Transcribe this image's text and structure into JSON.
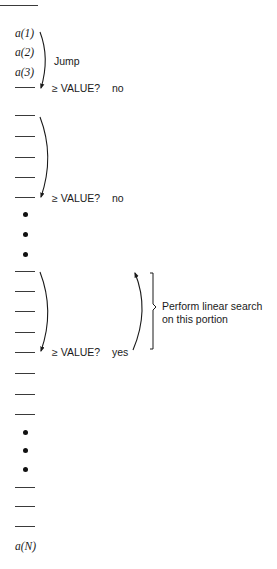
{
  "diagram": {
    "array_first": [
      "a(1)",
      "a(2)",
      "a(3)"
    ],
    "array_last": "a(N)",
    "jump_label": "Jump",
    "checks": [
      {
        "question": "≥ VALUE?",
        "answer": "no"
      },
      {
        "question": "≥ VALUE?",
        "answer": "no"
      },
      {
        "question": "≥ VALUE?",
        "answer": "yes"
      }
    ],
    "linear_search_label_line1": "Perform linear search",
    "linear_search_label_line2": "on this portion",
    "colors": {
      "ink": "#1a1a1a",
      "line": "#3a3a3a",
      "background": "#ffffff"
    }
  }
}
